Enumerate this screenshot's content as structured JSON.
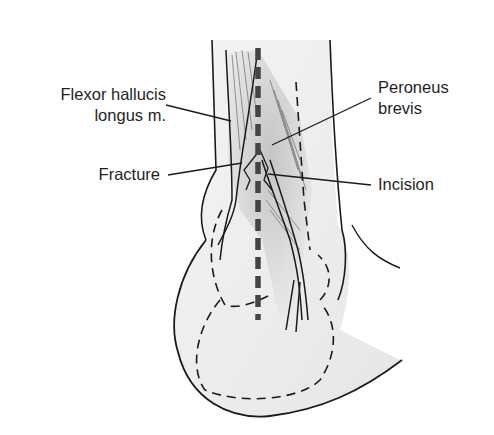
{
  "figure": {
    "type": "anatomical illustration",
    "labels": {
      "flexor_line1": "Flexor hallucis",
      "flexor_line2": "longus m.",
      "fracture": "Fracture",
      "peroneus_line1": "Peroneus",
      "peroneus_line2": "brevis",
      "incision": "Incision"
    },
    "colors": {
      "line": "#1a1a1a",
      "skin_shade": "#ececec",
      "muscle_shade": "#c8c8c8",
      "incision": "#444444"
    }
  }
}
